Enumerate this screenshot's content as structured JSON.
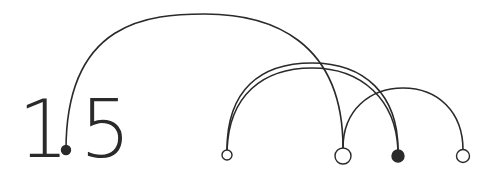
{
  "logo": {
    "digit_left": "1",
    "digit_right": "5",
    "reads_as": "1.5",
    "ink_color": "#2a2a2a",
    "background": "#ffffff"
  },
  "nodes": [
    {
      "id": "n0",
      "x": 66,
      "y": 150,
      "r": 4.5,
      "filled": true,
      "role": "decimal-point"
    },
    {
      "id": "n1",
      "x": 227,
      "y": 155,
      "r": 5,
      "filled": false
    },
    {
      "id": "n2",
      "x": 343,
      "y": 156,
      "r": 8,
      "filled": false
    },
    {
      "id": "n3",
      "x": 398,
      "y": 156,
      "r": 6,
      "filled": true
    },
    {
      "id": "n4",
      "x": 463,
      "y": 156,
      "r": 6.5,
      "filled": false
    }
  ],
  "arcs": [
    {
      "from": "n0",
      "to": "n2",
      "peak_y": 14
    },
    {
      "from": "n1",
      "to": "n3",
      "peak_y": 63
    },
    {
      "from": "n1",
      "to": "n3",
      "peak_y": 68
    },
    {
      "from": "n2",
      "to": "n4",
      "peak_y": 88
    }
  ]
}
